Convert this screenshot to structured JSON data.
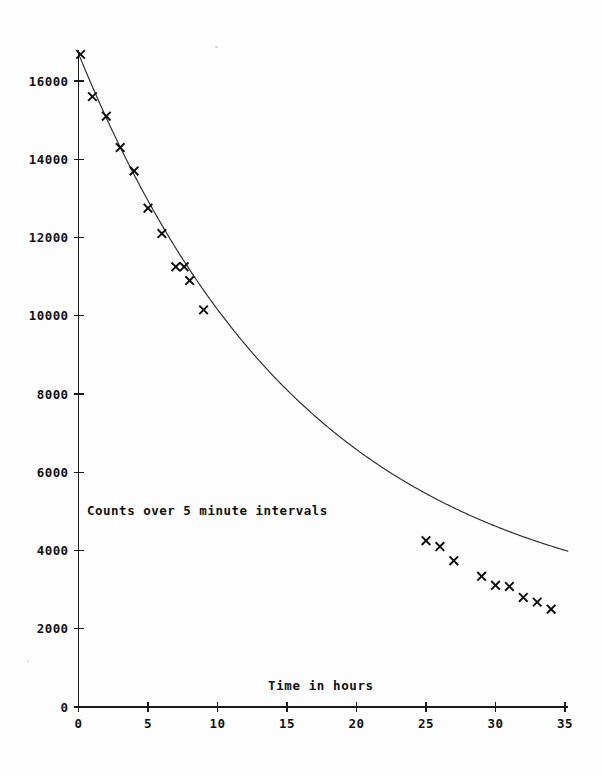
{
  "chart_data": {
    "type": "scatter",
    "title": "",
    "xlabel": "Time in hours",
    "ylabel": "",
    "annotation": "Counts over 5 minute intervals",
    "xlim": [
      0,
      35
    ],
    "ylim": [
      0,
      17000
    ],
    "grid": false,
    "legend": "none",
    "xticks": [
      0,
      5,
      10,
      15,
      20,
      25,
      30,
      35
    ],
    "xtick_labels": [
      "0",
      "5",
      "10",
      "15",
      "20",
      "25",
      "30",
      "35"
    ],
    "yticks": [
      0,
      2000,
      4000,
      6000,
      8000,
      10000,
      12000,
      14000,
      16000
    ],
    "ytick_labels": [
      "0",
      "2000",
      "4000",
      "6000",
      "8000",
      "10000",
      "12000",
      "14000",
      "16000"
    ],
    "series": [
      {
        "name": "measured counts",
        "marker": "x",
        "x": [
          0.15,
          1.0,
          2.0,
          3.0,
          4.0,
          5.0,
          6.0,
          7.0,
          7.6,
          8.0,
          9.0,
          25.0,
          26.0,
          27.0,
          29.0,
          30.0,
          31.0,
          32.0,
          33.0,
          34.0
        ],
        "y": [
          16680,
          15600,
          15100,
          14300,
          13700,
          12750,
          12100,
          11250,
          11250,
          10900,
          10150,
          4250,
          4100,
          3740,
          3340,
          3110,
          3080,
          2800,
          2680,
          2500
        ]
      },
      {
        "name": "fitted exponential decay curve",
        "marker": "line",
        "fit": {
          "model": "A*exp(-t/tau)+C",
          "A": 14450,
          "tau": 16.6,
          "C": 2250,
          "t_start": 0.1,
          "t_end": 35.2
        }
      }
    ]
  },
  "axes": {
    "x_axis_name": "time-axis",
    "y_axis_name": "counts-axis",
    "origin_label": "0"
  }
}
